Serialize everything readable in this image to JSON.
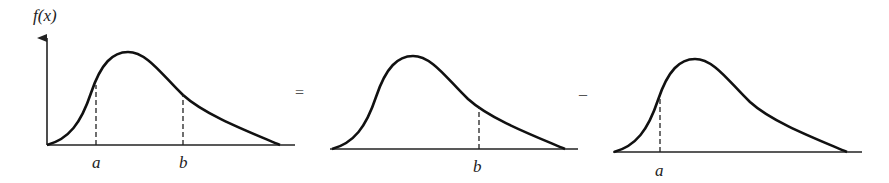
{
  "diagram": {
    "colors": {
      "curve": "#111111",
      "shade": "#8a8a8a",
      "axis": "#222222",
      "background": "#ffffff"
    },
    "panel1": {
      "y_axis_label": "f(x)",
      "lower_label": "a",
      "upper_label": "b",
      "shaded": "between a and b"
    },
    "operator1": "=",
    "panel2": {
      "upper_label": "b",
      "shaded": "left of b"
    },
    "operator2": "–",
    "panel3": {
      "upper_label": "a",
      "shaded": "left of a"
    }
  }
}
